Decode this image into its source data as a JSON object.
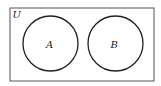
{
  "diagram": {
    "type": "venn",
    "universe": {
      "label": "U",
      "x": 10,
      "y": 8,
      "width": 144,
      "height": 73
    },
    "sets": [
      {
        "label": "A",
        "cx": 50.5,
        "cy": 43.5,
        "r": 27.5
      },
      {
        "label": "B",
        "cx": 115.5,
        "cy": 43.5,
        "r": 27.5
      }
    ],
    "colors": {
      "stroke": "#222222",
      "background": "#ffffff"
    }
  }
}
